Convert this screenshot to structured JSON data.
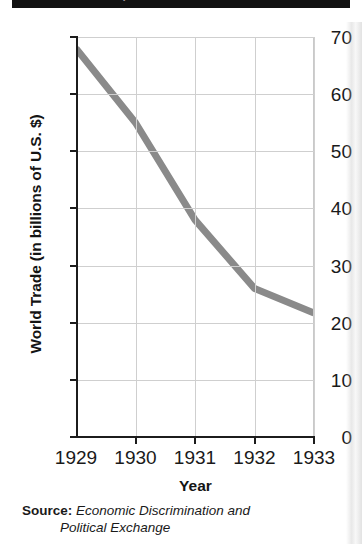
{
  "title": {
    "text": "World Trade, 1929–1933",
    "cut_off": true,
    "banner_color": "#121212",
    "text_color": "#ffffff"
  },
  "axes": {
    "y_title": "World Trade (in billions of U.S. $)",
    "x_title": "Year"
  },
  "source": {
    "label": "Source:",
    "title_line1": "Economic Discrimination and",
    "title_line2": "Political Exchange"
  },
  "chart_data": {
    "type": "line",
    "title": "World Trade, 1929–1933",
    "xlabel": "Year",
    "ylabel": "World Trade (in billions of U.S. $)",
    "x": [
      1929,
      1930,
      1931,
      1932,
      1933
    ],
    "categories": [
      "1929",
      "1930",
      "1931",
      "1932",
      "1933"
    ],
    "values": [
      68,
      55,
      38,
      26,
      21.7
    ],
    "series": [
      {
        "name": "World Trade",
        "values": [
          68,
          55,
          38,
          26,
          21.7
        ],
        "color": "#8a8a8a"
      }
    ],
    "xlim": [
      1929,
      1933
    ],
    "ylim": [
      0,
      70
    ],
    "yticks": [
      0,
      10,
      20,
      30,
      40,
      50,
      60,
      70
    ],
    "ytick_labels": [
      "0",
      "10",
      "20",
      "30",
      "40",
      "50",
      "60",
      "70"
    ],
    "xticks": [
      1929,
      1930,
      1931,
      1932,
      1933
    ],
    "xtick_labels": [
      "1929",
      "1930",
      "1931",
      "1932",
      "1933"
    ],
    "grid": true,
    "grid_color": "#cfcfcf",
    "legend": false,
    "line_color": "#8a8a8a",
    "line_width": 7
  }
}
